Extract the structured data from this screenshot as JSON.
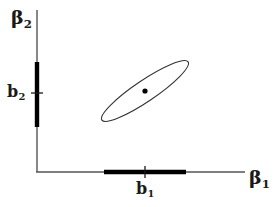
{
  "figure": {
    "background_color": "#ffffff",
    "line_color": "#2b2b2b",
    "band_color": "#000000",
    "point_color": "#000000",
    "ellipse_color": "#333333",
    "width": 279,
    "height": 207
  },
  "axes": {
    "y_axis": {
      "name_base": "β",
      "name_sub": "2",
      "origin_x": 37,
      "top_y": 10,
      "bottom_y": 172
    },
    "x_axis": {
      "name_base": "β",
      "name_sub": "1",
      "origin_y": 172,
      "left_x": 36,
      "right_x": 245
    }
  },
  "estimates": {
    "b1": {
      "label_base": "b",
      "label_sub": "1",
      "tick_x": 145,
      "interval_start_x": 104,
      "interval_end_x": 186
    },
    "b2": {
      "label_base": "b",
      "label_sub": "2",
      "tick_y": 93,
      "interval_start_y": 62,
      "interval_end_y": 127
    }
  },
  "confidence_ellipse": {
    "center_x": 145,
    "center_y": 91,
    "semi_major": 52,
    "semi_minor": 10.5,
    "rotation_deg": -34,
    "stroke_width": 1.1
  },
  "point_estimate": {
    "x": 145,
    "y": 91,
    "radius": 2.6
  },
  "chart_data": {
    "type": "scatter",
    "title": "",
    "xlabel": "β₁",
    "ylabel": "β₂",
    "grid": false,
    "legend": null,
    "annotations": [
      "b₁ marginal confidence interval on β₁ axis",
      "b₂ marginal confidence interval on β₂ axis",
      "joint confidence ellipse centred at (b₁, b₂)",
      "negatively correlated estimators (ellipse tilted downward)"
    ],
    "points": [
      {
        "name": "point estimate (b₁, b₂)",
        "x": 145,
        "y": 91
      }
    ],
    "series": [
      {
        "name": "joint confidence ellipse",
        "center": [
          145,
          91
        ],
        "semi_major": 52,
        "semi_minor": 10.5,
        "rotation_deg": -34
      },
      {
        "name": "b₁ marginal interval",
        "axis": "x",
        "from": 104,
        "to": 186,
        "tick": 145
      },
      {
        "name": "b₂ marginal interval",
        "axis": "y",
        "from": 62,
        "to": 127,
        "tick": 93
      }
    ]
  }
}
